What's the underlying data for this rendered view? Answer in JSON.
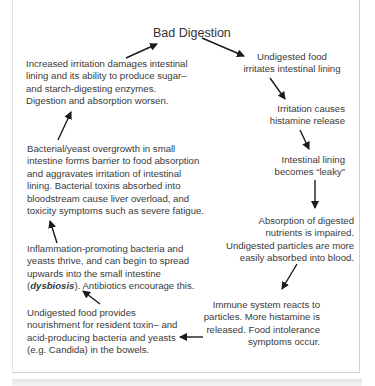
{
  "diagram": {
    "title": "Bad Digestion",
    "nodes": [
      {
        "id": "n1",
        "lines": [
          "Undigested food",
          "irritates intestinal lining"
        ]
      },
      {
        "id": "n2",
        "lines": [
          "Irritation causes",
          "histamine release"
        ]
      },
      {
        "id": "n3",
        "lines": [
          "Intestinal lining",
          "becomes “leaky”"
        ]
      },
      {
        "id": "n4",
        "lines": [
          "Absorption of digested",
          "nutrients is impaired.",
          "Undigested particles are more",
          "easily absorbed into blood."
        ]
      },
      {
        "id": "n5",
        "lines": [
          "Immune system reacts to",
          "particles. More histamine is",
          "released. Food intolerance",
          "symptoms occur."
        ]
      },
      {
        "id": "n6",
        "lines": [
          "Undigested food provides",
          "nourishment for resident toxin– and",
          "acid-producing bacteria and yeasts",
          "(e.g. Candida) in the bowels."
        ]
      },
      {
        "id": "n7",
        "lines": [
          "Inflammation-promoting bacteria and",
          "yeasts thrive, and can begin to spread",
          "upwards into the small intestine"
        ],
        "last_line_emphasis": "dysbiosis",
        "last_line_prefix": "(",
        "last_line_suffix": "). Antibiotics encourage this."
      },
      {
        "id": "n8",
        "lines": [
          "Bacterial/yeast overgrowth in small",
          "intestine forms barrier to food absorption",
          "and aggravates irritation of intestinal",
          "lining. Bacterial toxins absorbed into",
          "bloodstream cause liver overload, and",
          "toxicity symptoms such as severe fatigue."
        ]
      },
      {
        "id": "n9",
        "lines": [
          "Increased irritation damages intestinal",
          "lining and its ability to produce sugar–",
          "and starch-digesting enzymes.",
          "Digestion and absorption worsen."
        ]
      }
    ],
    "arrow_color": "#1a1a1a",
    "text_color": "#3a3a3a"
  }
}
